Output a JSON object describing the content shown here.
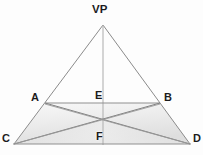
{
  "diagram": {
    "type": "geometric-perspective-diagram",
    "colors": {
      "background": "#fdfdfd",
      "line": "#8a8a8a",
      "line_dark": "#6f6f6f",
      "horizon": "#c9c9c9",
      "fill_light": "#f4f4f4",
      "fill_mid": "#e3e3e3",
      "label": "#1c1c1c"
    },
    "labels": {
      "vp": "VP",
      "a": "A",
      "b": "B",
      "c": "C",
      "d": "D",
      "e": "E",
      "f": "F"
    },
    "points": {
      "vp": {
        "x": 103,
        "y": 25
      },
      "a": {
        "x": 45,
        "y": 103
      },
      "b": {
        "x": 160,
        "y": 103
      },
      "c": {
        "x": 14,
        "y": 144
      },
      "d": {
        "x": 190,
        "y": 144
      },
      "e": {
        "x": 103,
        "y": 103
      },
      "f": {
        "x": 103,
        "y": 144
      },
      "center": {
        "x": 103,
        "y": 121
      }
    },
    "horizon": {
      "y": 23,
      "x1": 3,
      "x2": 200
    },
    "edges": [
      {
        "name": "vp-to-c",
        "from": "vp",
        "to": "c"
      },
      {
        "name": "vp-to-d",
        "from": "vp",
        "to": "d"
      },
      {
        "name": "vp-to-f",
        "from": "vp",
        "to": "f"
      },
      {
        "name": "a-to-b",
        "from": "a",
        "to": "b"
      },
      {
        "name": "c-to-d",
        "from": "c",
        "to": "d"
      },
      {
        "name": "a-to-d",
        "from": "a",
        "to": "d"
      },
      {
        "name": "b-to-c",
        "from": "b",
        "to": "c"
      },
      {
        "name": "c-to-b",
        "from": "c",
        "to": "b"
      },
      {
        "name": "d-to-a",
        "from": "d",
        "to": "a"
      }
    ],
    "shaded_region": {
      "name": "ground-plane-trapezoid",
      "vertices": [
        "a",
        "b",
        "d",
        "c"
      ]
    }
  }
}
